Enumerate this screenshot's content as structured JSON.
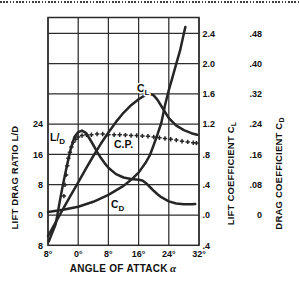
{
  "axes": {
    "x": {
      "title": "ANGLE OF ATTACK",
      "title_symbol": "α",
      "tick_labels": [
        "8°",
        "0°",
        "8°",
        "16°",
        "24°",
        "32°"
      ],
      "tick_values": [
        -8,
        0,
        8,
        16,
        24,
        32
      ]
    },
    "left": {
      "title": "LIFT DRAG RATIO L/D",
      "tick_labels": [
        "24",
        "16",
        "8",
        "0",
        "8"
      ],
      "tick_values": [
        24,
        16,
        8,
        0,
        -8
      ]
    },
    "right_cl": {
      "title_main": "LIFT COEFFICIENT C",
      "title_sub": "L",
      "tick_labels": [
        "2.4",
        "2.0",
        "1.6",
        "1.2",
        ".8",
        ".4",
        ".0",
        ".4"
      ],
      "tick_values": [
        2.4,
        2.0,
        1.6,
        1.2,
        0.8,
        0.4,
        0.0,
        -0.4
      ]
    },
    "right_cd": {
      "title_main": "DRAG COEFFICIENT C",
      "title_sub": "D",
      "tick_labels": [
        ".48",
        ".40",
        ".32",
        ".24",
        ".16",
        ".08",
        "0"
      ],
      "tick_values": [
        0.48,
        0.4,
        0.32,
        0.24,
        0.16,
        0.08,
        0
      ]
    }
  },
  "colors": {
    "ink": "#262626",
    "grid": "#2e2e2e",
    "background": "#ffffff"
  },
  "chart_data": {
    "type": "line",
    "xlabel": "ANGLE OF ATTACK α (degrees)",
    "x_range": [
      -8,
      32
    ],
    "grid": true,
    "axes_ranges": {
      "lift_drag_ratio": [
        -8,
        24
      ],
      "lift_coefficient": [
        -0.4,
        2.4
      ],
      "drag_coefficient": [
        0,
        0.48
      ]
    },
    "series": [
      {
        "name": "CL",
        "label_main": "C",
        "label_sub": "L",
        "axis": "CL",
        "style": "solid",
        "points": [
          [
            -8,
            -0.28
          ],
          [
            -6,
            -0.1
          ],
          [
            -4,
            0.08
          ],
          [
            -2,
            0.26
          ],
          [
            0,
            0.43
          ],
          [
            2,
            0.61
          ],
          [
            4,
            0.78
          ],
          [
            6,
            0.94
          ],
          [
            8,
            1.09
          ],
          [
            10,
            1.23
          ],
          [
            12,
            1.35
          ],
          [
            14,
            1.45
          ],
          [
            16,
            1.53
          ],
          [
            18,
            1.59
          ],
          [
            19,
            1.6
          ],
          [
            20,
            1.58
          ],
          [
            21,
            1.52
          ],
          [
            22,
            1.44
          ],
          [
            24,
            1.28
          ],
          [
            26,
            1.18
          ],
          [
            28,
            1.12
          ],
          [
            30,
            1.08
          ],
          [
            31.5,
            1.06
          ]
        ]
      },
      {
        "name": "CD",
        "label_main": "C",
        "label_sub": "D",
        "axis": "CD",
        "style": "solid",
        "points": [
          [
            -8,
            0.008
          ],
          [
            -4,
            0.014
          ],
          [
            0,
            0.022
          ],
          [
            4,
            0.035
          ],
          [
            8,
            0.053
          ],
          [
            12,
            0.077
          ],
          [
            14,
            0.093
          ],
          [
            16,
            0.112
          ],
          [
            18,
            0.14
          ],
          [
            19,
            0.158
          ],
          [
            20,
            0.185
          ],
          [
            21,
            0.213
          ],
          [
            22,
            0.243
          ],
          [
            23,
            0.29
          ],
          [
            24,
            0.33
          ],
          [
            25,
            0.365
          ],
          [
            26,
            0.4
          ],
          [
            27,
            0.435
          ],
          [
            28,
            0.48
          ],
          [
            28.4,
            0.497
          ]
        ]
      },
      {
        "name": "LD",
        "label_main": "L/",
        "label_sub": "D",
        "axis": "LD",
        "style": "solid",
        "points": [
          [
            -7.8,
            -7
          ],
          [
            -7,
            -5
          ],
          [
            -6,
            -2.6
          ],
          [
            -5.5,
            0
          ],
          [
            -5,
            2.9
          ],
          [
            -4.5,
            5.6
          ],
          [
            -4,
            8.2
          ],
          [
            -3,
            13
          ],
          [
            -2,
            17.4
          ],
          [
            -1,
            20.6
          ],
          [
            0,
            21.9
          ],
          [
            1,
            22.3
          ],
          [
            2,
            21.7
          ],
          [
            3,
            20.2
          ],
          [
            4,
            18.5
          ],
          [
            5,
            16.7
          ],
          [
            6,
            15.1
          ],
          [
            7,
            13.7
          ],
          [
            8,
            12.5
          ],
          [
            10,
            10.8
          ],
          [
            12,
            9.9
          ],
          [
            14,
            9.5
          ],
          [
            16,
            9.3
          ],
          [
            17,
            9.1
          ],
          [
            18,
            8.4
          ],
          [
            19,
            7.4
          ],
          [
            20,
            6.4
          ],
          [
            21,
            5.5
          ],
          [
            22,
            4.7
          ],
          [
            24,
            3.6
          ],
          [
            26,
            3.05
          ],
          [
            28,
            2.85
          ],
          [
            30,
            2.85
          ],
          [
            31,
            2.9
          ]
        ]
      },
      {
        "name": "CP",
        "label": "C.P.",
        "axis": "CL",
        "style": "plus-markers",
        "note": "center of pressure; no numeric scale labeled, ordinate given in lift-coefficient axis units",
        "points": [
          [
            -3.8,
            0.25
          ],
          [
            -3.5,
            0.4
          ],
          [
            -3.2,
            0.53
          ],
          [
            -2.9,
            0.65
          ],
          [
            -2.6,
            0.75
          ],
          [
            -2.2,
            0.83
          ],
          [
            -1.8,
            0.9
          ],
          [
            -1.3,
            0.96
          ],
          [
            -0.7,
            1.0
          ],
          [
            0,
            1.03
          ],
          [
            1,
            1.05
          ],
          [
            2.2,
            1.06
          ],
          [
            3.5,
            1.06
          ],
          [
            5,
            1.07
          ],
          [
            6.5,
            1.07
          ],
          [
            8,
            1.06
          ],
          [
            9.5,
            1.06
          ],
          [
            11,
            1.06
          ],
          [
            12.5,
            1.055
          ],
          [
            14,
            1.05
          ],
          [
            15.5,
            1.05
          ],
          [
            17,
            1.045
          ],
          [
            18.5,
            1.04
          ],
          [
            20,
            1.03
          ],
          [
            21.5,
            1.02
          ],
          [
            23,
            1.01
          ],
          [
            24.5,
            1.0
          ],
          [
            26,
            0.99
          ],
          [
            27.5,
            0.975
          ],
          [
            29,
            0.965
          ],
          [
            30.5,
            0.955
          ],
          [
            31.3,
            0.95
          ]
        ]
      }
    ]
  }
}
